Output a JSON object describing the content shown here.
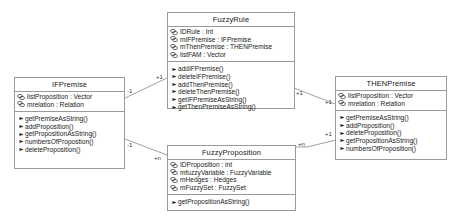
{
  "diagram": {
    "type": "UML class diagram",
    "classes": [
      {
        "id": "FuzzyRule",
        "name": "FuzzyRule",
        "attributes": [
          "IDRule : Int",
          "mIFPremise : IFPremise",
          "mThenPremise : THENPremise",
          "listFAM : Vector"
        ],
        "operations": [
          "addIFPremise()",
          "deleteIFPremise()",
          "addThenPremise()",
          "deleteThenPremise()",
          "getIFPremiseAsString()",
          "getThenPremiseAsString()"
        ]
      },
      {
        "id": "IFPremise",
        "name": "IFPremise",
        "attributes": [
          "listProposition : Vector",
          "mrelation : Relation"
        ],
        "operations": [
          "getPremiseAsString()",
          "addProposition()",
          "getPropositionAsString()",
          "numbersOfPropostion()",
          "deleteProposition()"
        ]
      },
      {
        "id": "THENPremise",
        "name": "THENPremise",
        "attributes": [
          "listProposition : Vector",
          "mrelation : Relation"
        ],
        "operations": [
          "getPremiseAsString()",
          "addProposition()",
          "deleteProposition()",
          "getPropositionAsString()",
          "numbersOfProposition()"
        ]
      },
      {
        "id": "FuzzyProposition",
        "name": "FuzzyProposition",
        "attributes": [
          "IDProposition : int",
          "mfuzzyVariable : FuzzyVariable",
          "mHedges : Hedges",
          "mFuzzySet : FuzzySet"
        ],
        "operations": [
          "getPropositionAsString()"
        ]
      }
    ],
    "associations": [
      {
        "from": "IFPremise",
        "to": "FuzzyRule",
        "from_mult": "-1",
        "to_mult": "+1"
      },
      {
        "from": "FuzzyRule",
        "to": "THENPremise",
        "from_mult": "+1",
        "to_mult": "+1"
      },
      {
        "from": "IFPremise",
        "to": "FuzzyProposition",
        "from_mult": "-1",
        "to_mult": "+n"
      },
      {
        "from": "FuzzyProposition",
        "to": "THENPremise",
        "from_mult": "+n",
        "to_mult": "+1"
      }
    ],
    "colors": {
      "border": "#9a9a9a",
      "line": "#8a8a8a",
      "text": "#1a1a1a"
    }
  }
}
